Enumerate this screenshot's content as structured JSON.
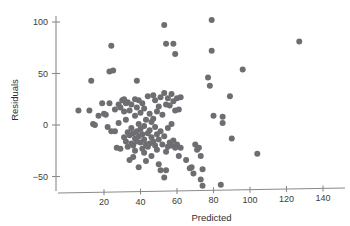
{
  "chart_data": {
    "type": "scatter",
    "title": "",
    "xlabel": "Predicted",
    "ylabel": "Residuals",
    "xlim": [
      2,
      148
    ],
    "ylim": [
      -68,
      110
    ],
    "xticks": [
      20,
      40,
      60,
      80,
      100,
      120,
      140
    ],
    "yticks": [
      -50,
      0,
      50,
      100
    ],
    "xticklabels": [
      "20",
      "40",
      "60",
      "80",
      "100",
      "120",
      "140"
    ],
    "yticklabels": [
      "−50",
      "0",
      "50",
      "100"
    ],
    "grid": false,
    "legend": false,
    "point_color": "#6e6e72",
    "axis_color": "#8a8a8a",
    "marker_size": 3.0,
    "n_points": 131,
    "points": [
      [
        6,
        14
      ],
      [
        12,
        14
      ],
      [
        13,
        43
      ],
      [
        14,
        1
      ],
      [
        15,
        0
      ],
      [
        17,
        9
      ],
      [
        19,
        21
      ],
      [
        20,
        11
      ],
      [
        21,
        10
      ],
      [
        22,
        -2
      ],
      [
        23,
        52
      ],
      [
        23,
        21
      ],
      [
        24,
        77
      ],
      [
        24,
        -6
      ],
      [
        25,
        53
      ],
      [
        26,
        15
      ],
      [
        26,
        -6
      ],
      [
        27,
        -22
      ],
      [
        28,
        20
      ],
      [
        28,
        2
      ],
      [
        29,
        17
      ],
      [
        29,
        -23
      ],
      [
        30,
        24
      ],
      [
        31,
        25
      ],
      [
        31,
        13
      ],
      [
        31,
        -12
      ],
      [
        32,
        21
      ],
      [
        32,
        5
      ],
      [
        32,
        -16
      ],
      [
        33,
        22
      ],
      [
        33,
        -7
      ],
      [
        33,
        -21
      ],
      [
        34,
        14
      ],
      [
        34,
        -10
      ],
      [
        34,
        -34
      ],
      [
        35,
        20
      ],
      [
        35,
        -3
      ],
      [
        35,
        -18
      ],
      [
        36,
        -8
      ],
      [
        36,
        -20
      ],
      [
        36,
        -31
      ],
      [
        37,
        25
      ],
      [
        37,
        9
      ],
      [
        37,
        -13
      ],
      [
        37,
        -25
      ],
      [
        38,
        43
      ],
      [
        38,
        17
      ],
      [
        38,
        -6
      ],
      [
        38,
        -16
      ],
      [
        39,
        24
      ],
      [
        39,
        1
      ],
      [
        39,
        -11
      ],
      [
        39,
        -41
      ],
      [
        40,
        12
      ],
      [
        40,
        -4
      ],
      [
        40,
        -17
      ],
      [
        41,
        21
      ],
      [
        41,
        -9
      ],
      [
        41,
        -23
      ],
      [
        42,
        16
      ],
      [
        42,
        -1
      ],
      [
        42,
        -14
      ],
      [
        42,
        -27
      ],
      [
        43,
        5
      ],
      [
        43,
        -19
      ],
      [
        43,
        -35
      ],
      [
        44,
        28
      ],
      [
        44,
        -8
      ],
      [
        44,
        -21
      ],
      [
        45,
        11
      ],
      [
        45,
        -5
      ],
      [
        45,
        -18
      ],
      [
        46,
        3
      ],
      [
        46,
        -12
      ],
      [
        46,
        -30
      ],
      [
        47,
        29
      ],
      [
        47,
        6
      ],
      [
        47,
        -16
      ],
      [
        48,
        24
      ],
      [
        48,
        -2
      ],
      [
        48,
        -20
      ],
      [
        49,
        13
      ],
      [
        49,
        -9
      ],
      [
        49,
        -24
      ],
      [
        50,
        18
      ],
      [
        50,
        -14
      ],
      [
        50,
        -38
      ],
      [
        51,
        27
      ],
      [
        51,
        -6
      ],
      [
        51,
        -44
      ],
      [
        52,
        10
      ],
      [
        52,
        -19
      ],
      [
        53,
        97
      ],
      [
        53,
        31
      ],
      [
        53,
        -11
      ],
      [
        53,
        -51
      ],
      [
        54,
        79
      ],
      [
        54,
        20
      ],
      [
        54,
        -26
      ],
      [
        54,
        -44
      ],
      [
        55,
        26
      ],
      [
        55,
        -3
      ],
      [
        55,
        -21
      ],
      [
        56,
        19
      ],
      [
        56,
        -17
      ],
      [
        57,
        30
      ],
      [
        57,
        1
      ],
      [
        57,
        -20
      ],
      [
        58,
        79
      ],
      [
        58,
        23
      ],
      [
        58,
        -15
      ],
      [
        59,
        69
      ],
      [
        59,
        14
      ],
      [
        59,
        -22
      ],
      [
        60,
        26
      ],
      [
        60,
        -19
      ],
      [
        61,
        15
      ],
      [
        61,
        -30
      ],
      [
        62,
        27
      ],
      [
        62,
        -22
      ],
      [
        65,
        -34
      ],
      [
        67,
        -42
      ],
      [
        68,
        -41
      ],
      [
        69,
        -47
      ],
      [
        70,
        -19
      ],
      [
        71,
        -24
      ],
      [
        72,
        -22
      ],
      [
        73,
        -30
      ],
      [
        73,
        -53
      ],
      [
        74,
        -43
      ],
      [
        74,
        -59
      ],
      [
        77,
        46
      ],
      [
        78,
        38
      ],
      [
        79,
        102
      ],
      [
        79,
        72
      ],
      [
        80,
        9
      ],
      [
        84,
        -58
      ],
      [
        85,
        8
      ],
      [
        85,
        2
      ],
      [
        89,
        28
      ],
      [
        90,
        -13
      ],
      [
        96,
        54
      ],
      [
        104,
        -28
      ],
      [
        127,
        81
      ]
    ]
  }
}
